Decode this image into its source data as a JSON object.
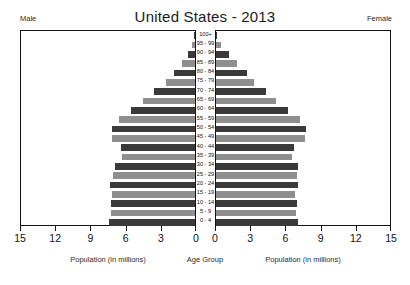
{
  "chart_data": {
    "type": "bar",
    "chart_subtype": "population-pyramid",
    "title": "United States - 2013",
    "left_side_label": "Male",
    "right_side_label": "Female",
    "center_axis_label": "Age Group",
    "xlabel_left": "Population (in millions)",
    "xlabel_right": "Population (in millions)",
    "ylabel": "Age Group",
    "xlim": [
      0,
      15
    ],
    "tick_values_left": [
      15,
      12,
      9,
      6,
      3,
      0
    ],
    "tick_values_right": [
      0,
      3,
      6,
      9,
      12,
      15
    ],
    "grid": false,
    "legend": false,
    "categories": [
      "100+",
      "95 - 99",
      "90 - 94",
      "85 - 89",
      "80 - 84",
      "75 - 79",
      "70 - 74",
      "65 - 69",
      "60 - 64",
      "55 - 59",
      "50 - 54",
      "45 - 49",
      "40 - 44",
      "35 - 39",
      "30 - 34",
      "25 - 29",
      "20 - 24",
      "15 - 19",
      "10 - 14",
      "5 - 9",
      "0 - 4"
    ],
    "series": [
      {
        "name": "Male",
        "side": "left",
        "color": "#4d4d4d",
        "values": [
          0.06,
          0.23,
          0.62,
          1.08,
          1.78,
          2.44,
          3.5,
          4.42,
          5.43,
          6.48,
          7.1,
          7.1,
          6.3,
          6.25,
          6.85,
          7.0,
          7.25,
          7.05,
          7.2,
          7.15,
          7.3
        ]
      },
      {
        "name": "Female",
        "side": "right",
        "color": "#4d4d4d",
        "values": [
          0.1,
          0.42,
          1.1,
          1.78,
          2.63,
          3.27,
          4.3,
          5.14,
          6.13,
          7.12,
          7.7,
          7.6,
          6.65,
          6.45,
          6.95,
          6.9,
          6.95,
          6.7,
          6.9,
          6.85,
          7.0
        ]
      }
    ],
    "bar_colors_alternating": [
      "#3a3a3a",
      "#8f8f8f"
    ],
    "axis_color": "#141414",
    "background_color": "#ffffff"
  },
  "header": {
    "title": "United States - 2013"
  },
  "labels": {
    "male": "Male",
    "female": "Female",
    "age_group": "Age Group",
    "population_left": "Population (in millions)",
    "population_right": "Population (in millions)"
  }
}
